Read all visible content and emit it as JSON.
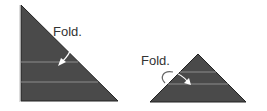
{
  "figures": [
    {
      "label": "Fold.",
      "shape": "right-triangle"
    },
    {
      "label": "Fold.",
      "shape": "isosceles-triangle"
    }
  ],
  "colors": {
    "fill": "#4a4a4a",
    "stroke": "#222222",
    "crease": "#8c8c8c",
    "arrow": "#ffffff"
  }
}
